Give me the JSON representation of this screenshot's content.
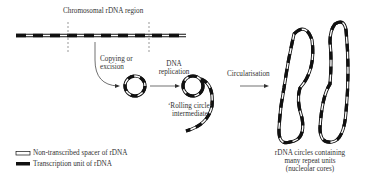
{
  "diagram": {
    "labels": {
      "chromosomal_region": "Chromosomal rDNA region",
      "copying_line1": "Copying or",
      "copying_line2": "excision",
      "dna_line1": "DNA",
      "dna_line2": "replication",
      "rolling_line1": "‘Rolling circle’",
      "rolling_line2": "intermediate",
      "circularisation": "Circularisation",
      "result_line1": "rDNA circles containing",
      "result_line2": "many repeat units",
      "result_line3": "(nucleolar cores)"
    },
    "legend": [
      {
        "symbol": "open-bar",
        "label": "Non-transcribed spacer of rDNA"
      },
      {
        "symbol": "solid-bar",
        "label": "Transcription unit of rDNA"
      }
    ],
    "colors": {
      "ink": "#111111",
      "background": "#ffffff"
    }
  }
}
